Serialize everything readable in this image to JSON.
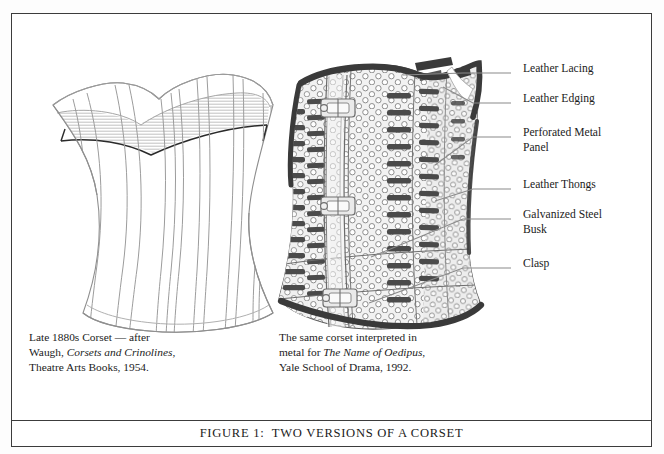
{
  "figure": {
    "caption": "FIGURE 1:  TWO VERSIONS OF A CORSET",
    "border_color": "#3c3c3c",
    "background_color": "#ffffff"
  },
  "panels": [
    {
      "id": "left-corset",
      "illustration": "late-1880s-fabric-corset-line-drawing",
      "caption_lines": [
        {
          "pre": "Late 1880s Corset — after",
          "italic": "",
          "post": ""
        },
        {
          "pre": "Waugh, ",
          "italic": "Corsets and Crinolines",
          "post": ","
        },
        {
          "pre": "Theatre Arts Books, 1954.",
          "italic": "",
          "post": ""
        }
      ]
    },
    {
      "id": "right-corset",
      "illustration": "perforated-metal-corset-drawing",
      "caption_lines": [
        {
          "pre": "The same corset interpreted in",
          "italic": "",
          "post": ""
        },
        {
          "pre": "metal for ",
          "italic": "The Name of Oedipus",
          "post": ","
        },
        {
          "pre": "Yale School of Drama, 1992.",
          "italic": "",
          "post": ""
        }
      ]
    }
  ],
  "annotations": [
    {
      "label": "Leather Lacing",
      "leader_from_x": 500,
      "leader_from_y": 60,
      "leader_to_x": 392,
      "leader_to_y": 60
    },
    {
      "label": "Leather Edging",
      "leader_from_x": 500,
      "leader_from_y": 90,
      "leader_to_x": 432,
      "leader_to_y": 74
    },
    {
      "label": "Perforated Metal\nPanel",
      "leader_from_x": 500,
      "leader_from_y": 124,
      "leader_to_x": 424,
      "leader_to_y": 152
    },
    {
      "label": "Leather Thongs",
      "leader_from_x": 500,
      "leader_from_y": 176,
      "leader_to_x": 424,
      "leader_to_y": 188
    },
    {
      "label": "Galvanized Steel\nBusk",
      "leader_from_x": 500,
      "leader_from_y": 206,
      "leader_to_x": 360,
      "leader_to_y": 244
    },
    {
      "label": "Clasp",
      "leader_from_x": 500,
      "leader_from_y": 255,
      "leader_to_x": 358,
      "leader_to_y": 290
    }
  ],
  "colors": {
    "ink": "#1a1a1a",
    "leader_line": "#8a8a8a",
    "seam_line": "#9a9a9a",
    "metal_dark": "#4a4a4a",
    "metal_mid": "#8d8d8d",
    "metal_light": "#d8d8d8"
  }
}
